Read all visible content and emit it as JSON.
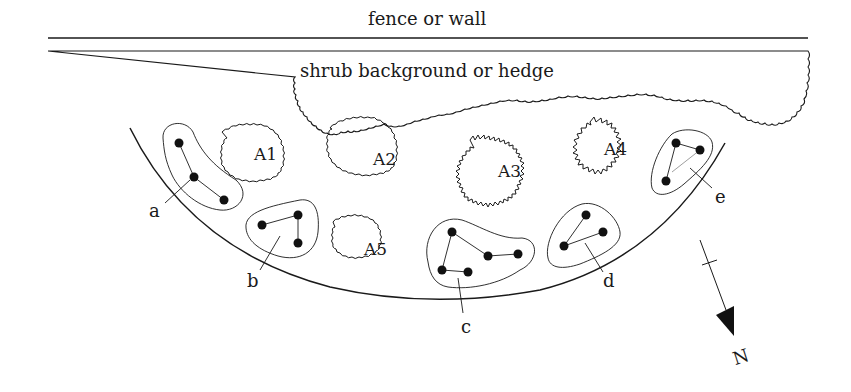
{
  "diagram": {
    "fence_label": "fence or wall",
    "hedge_label": "shrub background or hedge",
    "areas": [
      {
        "id": "A1",
        "label": "A1"
      },
      {
        "id": "A2",
        "label": "A2"
      },
      {
        "id": "A3",
        "label": "A3"
      },
      {
        "id": "A4",
        "label": "A4"
      },
      {
        "id": "A5",
        "label": "A5"
      }
    ],
    "groups": [
      {
        "id": "a",
        "label": "a",
        "points": 3
      },
      {
        "id": "b",
        "label": "b",
        "points": 3
      },
      {
        "id": "c",
        "label": "c",
        "points": 5
      },
      {
        "id": "d",
        "label": "d",
        "points": 3
      },
      {
        "id": "e",
        "label": "e",
        "points": 3
      }
    ],
    "north_label": "N",
    "colors": {
      "ink": "#1a1a1a",
      "background": "#ffffff"
    }
  }
}
